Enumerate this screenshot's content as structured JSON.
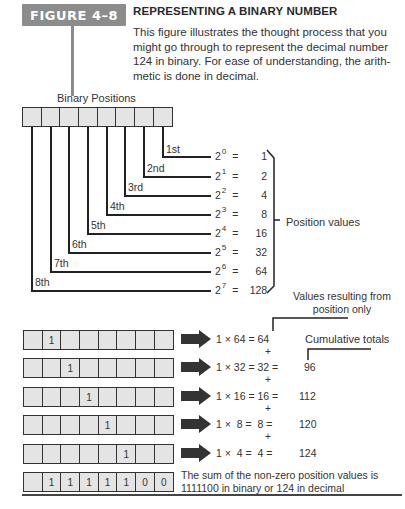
{
  "figure": {
    "badge": "FIGURE 4–8",
    "title": "REPRESENTING A BINARY NUMBER",
    "description": "This figure illustrates the thought process that you might go through to represent the decimal number 124 in binary. For ease of understanding, the arith-metic is done in decimal.",
    "badge_color": "#8c8c8c"
  },
  "positions": {
    "heading": "Binary Positions",
    "ordinals": [
      "1st",
      "2nd",
      "3rd",
      "4th",
      "5th",
      "6th",
      "7th",
      "8th"
    ],
    "powers": [
      {
        "base": "2",
        "exp": "0",
        "value": "1"
      },
      {
        "base": "2",
        "exp": "1",
        "value": "2"
      },
      {
        "base": "2",
        "exp": "2",
        "value": "4"
      },
      {
        "base": "2",
        "exp": "3",
        "value": "8"
      },
      {
        "base": "2",
        "exp": "4",
        "value": "16"
      },
      {
        "base": "2",
        "exp": "5",
        "value": "32"
      },
      {
        "base": "2",
        "exp": "6",
        "value": "64"
      },
      {
        "base": "2",
        "exp": "7",
        "value": "128"
      }
    ],
    "bracket_label": "Position values"
  },
  "steps": {
    "values_label": "Values resulting from position only",
    "values_label_line1": "Values resulting from",
    "values_label_line2": "position only",
    "cumulative_label": "Cumulative totals",
    "rows": [
      {
        "bits": [
          "",
          "1",
          "",
          "",
          "",
          "",
          "",
          ""
        ],
        "expr": "1 × 64 = 64",
        "cumulative": ""
      },
      {
        "bits": [
          "",
          "",
          "1",
          "",
          "",
          "",
          "",
          ""
        ],
        "expr": "1 × 32 = 32 =",
        "cumulative": "96"
      },
      {
        "bits": [
          "",
          "",
          "",
          "1",
          "",
          "",
          "",
          ""
        ],
        "expr": "1 × 16 = 16 =",
        "cumulative": "112"
      },
      {
        "bits": [
          "",
          "",
          "",
          "",
          "1",
          "",
          "",
          ""
        ],
        "expr": "1 ×  8 =  8 =",
        "cumulative": "120"
      },
      {
        "bits": [
          "",
          "",
          "",
          "",
          "",
          "1",
          "",
          ""
        ],
        "expr": "1 ×  4 =  4 =",
        "cumulative": "124"
      }
    ],
    "plus": "+",
    "final_bits": [
      "",
      "1",
      "1",
      "1",
      "1",
      "1",
      "0",
      "0"
    ],
    "summary_line1": "The sum of the non-zero position values is",
    "summary_line2": "1111100 in binary or 124 in decimal"
  }
}
